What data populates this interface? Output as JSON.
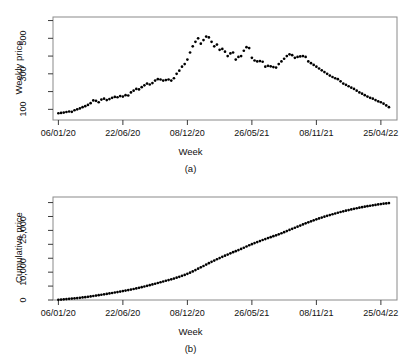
{
  "figures": [
    {
      "panel": "(a)",
      "ylabel": "Weekly price",
      "xlabel": "Week"
    },
    {
      "panel": "(b)",
      "ylabel": "Cumulative price",
      "xlabel": "Week"
    }
  ],
  "chart_data": [
    {
      "type": "scatter",
      "panel": "(a)",
      "title": "",
      "xlabel": "Week",
      "ylabel": "Weekly price",
      "x_tick_labels": [
        "06/01/20",
        "22/06/20",
        "08/12/20",
        "26/05/21",
        "08/11/21",
        "25/04/22"
      ],
      "x_tick_indices": [
        0,
        24,
        48,
        72,
        96,
        120
      ],
      "y_tick_labels": [
        "100",
        "300",
        "500"
      ],
      "y_tick_values": [
        100,
        300,
        500
      ],
      "y_minor_ticks": [
        200,
        400,
        600
      ],
      "ylim": [
        40,
        620
      ],
      "xlim": [
        -2,
        126
      ],
      "grid": false,
      "legend": false,
      "marker": "filled-circle",
      "marker_color": "#000000",
      "x": [
        0,
        1,
        2,
        3,
        4,
        5,
        6,
        7,
        8,
        9,
        10,
        11,
        12,
        13,
        14,
        15,
        16,
        17,
        18,
        19,
        20,
        21,
        22,
        23,
        24,
        25,
        26,
        27,
        28,
        29,
        30,
        31,
        32,
        33,
        34,
        35,
        36,
        37,
        38,
        39,
        40,
        41,
        42,
        43,
        44,
        45,
        46,
        47,
        48,
        49,
        50,
        51,
        52,
        53,
        54,
        55,
        56,
        57,
        58,
        59,
        60,
        61,
        62,
        63,
        64,
        65,
        66,
        67,
        68,
        69,
        70,
        71,
        72,
        73,
        74,
        75,
        76,
        77,
        78,
        79,
        80,
        81,
        82,
        83,
        84,
        85,
        86,
        87,
        88,
        89,
        90,
        91,
        92,
        93,
        94,
        95,
        96,
        97,
        98,
        99,
        100,
        101,
        102,
        103,
        104,
        105,
        106,
        107,
        108,
        109,
        110,
        111,
        112,
        113,
        114,
        115,
        116,
        117,
        118,
        119,
        120,
        121,
        122,
        123
      ],
      "values": [
        78,
        80,
        82,
        85,
        88,
        86,
        95,
        100,
        105,
        112,
        118,
        125,
        135,
        150,
        148,
        140,
        155,
        160,
        152,
        158,
        165,
        170,
        168,
        175,
        172,
        180,
        178,
        195,
        205,
        215,
        212,
        225,
        235,
        245,
        240,
        248,
        262,
        270,
        268,
        262,
        265,
        268,
        262,
        275,
        300,
        318,
        340,
        355,
        380,
        420,
        455,
        480,
        500,
        470,
        490,
        510,
        505,
        480,
        455,
        465,
        435,
        440,
        425,
        400,
        415,
        420,
        380,
        395,
        400,
        430,
        450,
        445,
        390,
        375,
        370,
        372,
        368,
        340,
        345,
        342,
        338,
        335,
        355,
        370,
        385,
        400,
        410,
        405,
        390,
        395,
        398,
        400,
        395,
        370,
        360,
        350,
        340,
        330,
        320,
        310,
        300,
        290,
        282,
        275,
        270,
        258,
        245,
        238,
        230,
        222,
        215,
        205,
        195,
        188,
        180,
        172,
        165,
        160,
        152,
        145,
        140,
        132,
        122,
        112
      ],
      "n_points": 124
    },
    {
      "type": "line",
      "panel": "(b)",
      "title": "",
      "xlabel": "Week",
      "ylabel": "Cumulative price",
      "x_tick_labels": [
        "06/01/20",
        "22/06/20",
        "08/12/20",
        "26/05/21",
        "08/11/21",
        "25/04/22"
      ],
      "x_tick_indices": [
        0,
        24,
        48,
        72,
        96,
        120
      ],
      "y_tick_labels": [
        "0",
        "10,000",
        "25,000"
      ],
      "y_tick_values": [
        0,
        10000,
        25000
      ],
      "y_minor_ticks": [
        5000,
        15000,
        20000,
        30000,
        35000
      ],
      "ylim": [
        0,
        37000
      ],
      "xlim": [
        -2,
        126
      ],
      "grid": false,
      "legend": false,
      "marker": "filled-circle",
      "marker_color": "#000000",
      "x": [
        0,
        1,
        2,
        3,
        4,
        5,
        6,
        7,
        8,
        9,
        10,
        11,
        12,
        13,
        14,
        15,
        16,
        17,
        18,
        19,
        20,
        21,
        22,
        23,
        24,
        25,
        26,
        27,
        28,
        29,
        30,
        31,
        32,
        33,
        34,
        35,
        36,
        37,
        38,
        39,
        40,
        41,
        42,
        43,
        44,
        45,
        46,
        47,
        48,
        49,
        50,
        51,
        52,
        53,
        54,
        55,
        56,
        57,
        58,
        59,
        60,
        61,
        62,
        63,
        64,
        65,
        66,
        67,
        68,
        69,
        70,
        71,
        72,
        73,
        74,
        75,
        76,
        77,
        78,
        79,
        80,
        81,
        82,
        83,
        84,
        85,
        86,
        87,
        88,
        89,
        90,
        91,
        92,
        93,
        94,
        95,
        96,
        97,
        98,
        99,
        100,
        101,
        102,
        103,
        104,
        105,
        106,
        107,
        108,
        109,
        110,
        111,
        112,
        113,
        114,
        115,
        116,
        117,
        118,
        119,
        120,
        121,
        122,
        123
      ],
      "values": [
        78,
        158,
        240,
        325,
        413,
        499,
        594,
        694,
        799,
        911,
        1029,
        1154,
        1289,
        1439,
        1587,
        1727,
        1882,
        2042,
        2194,
        2352,
        2517,
        2687,
        2855,
        3030,
        3202,
        3382,
        3560,
        3755,
        3960,
        4175,
        4387,
        4612,
        4847,
        5092,
        5332,
        5580,
        5842,
        6112,
        6380,
        6642,
        6907,
        7175,
        7437,
        7712,
        8012,
        8330,
        8670,
        9025,
        9405,
        9825,
        10280,
        10760,
        11260,
        11730,
        12220,
        12730,
        13235,
        13715,
        14170,
        14635,
        15070,
        15510,
        15935,
        16335,
        16750,
        17170,
        17550,
        17945,
        18345,
        18775,
        19225,
        19670,
        20060,
        20435,
        20805,
        21177,
        21545,
        21885,
        22230,
        22572,
        22910,
        23245,
        23600,
        23970,
        24355,
        24755,
        25165,
        25570,
        25960,
        26355,
        26753,
        27153,
        27548,
        27918,
        28278,
        28628,
        28968,
        29298,
        29618,
        29928,
        30228,
        30518,
        30800,
        31075,
        31345,
        31603,
        31848,
        32086,
        32316,
        32538,
        32753,
        32958,
        33153,
        33341,
        33521,
        33693,
        33858,
        34018,
        34170,
        34315,
        34455,
        34587,
        34709,
        34821
      ],
      "final_value": 34821
    }
  ]
}
